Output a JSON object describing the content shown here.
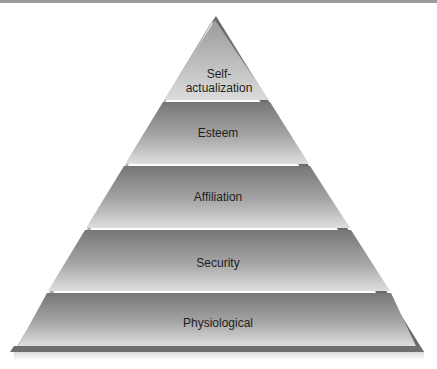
{
  "diagram": {
    "type": "pyramid",
    "levels_top_to_bottom": [
      {
        "id": "self-actualization",
        "label_lines": [
          "Self-",
          "actualization"
        ],
        "label": "Self-actualization"
      },
      {
        "id": "esteem",
        "label": "Esteem"
      },
      {
        "id": "affiliation",
        "label": "Affiliation"
      },
      {
        "id": "security",
        "label": "Security"
      },
      {
        "id": "physiological",
        "label": "Physiological"
      }
    ]
  },
  "colors": {
    "band_top": "#7e7e7e",
    "band_bottom": "#dadada",
    "apex_top": "#a9a9a9",
    "left_bevel": "#acacac",
    "right_bevel": "#6a6a6a",
    "base": "#6e6e6e",
    "text": "#1e1e1e",
    "top_bar": "#9b9b9b"
  }
}
